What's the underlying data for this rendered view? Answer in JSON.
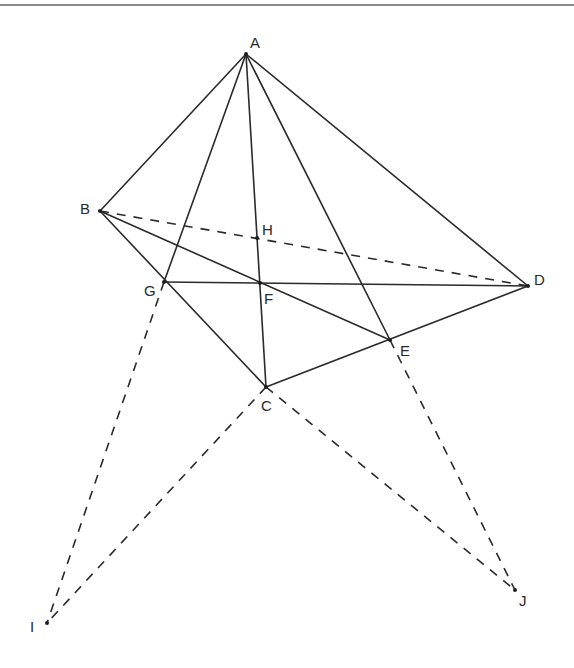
{
  "figure": {
    "type": "geometry-diagram",
    "points": {
      "A": {
        "label": "A",
        "x": 246,
        "y": 54
      },
      "B": {
        "label": "B",
        "x": 100,
        "y": 211
      },
      "C": {
        "label": "C",
        "x": 266,
        "y": 387
      },
      "D": {
        "label": "D",
        "x": 528,
        "y": 286
      },
      "E": {
        "label": "E",
        "x": 390,
        "y": 340
      },
      "F": {
        "label": "F",
        "x": 260,
        "y": 283
      },
      "G": {
        "label": "G",
        "x": 164,
        "y": 282
      },
      "H": {
        "label": "H",
        "x": 257,
        "y": 238
      },
      "I": {
        "label": "I",
        "x": 47,
        "y": 623
      },
      "J": {
        "label": "J",
        "x": 515,
        "y": 590
      }
    },
    "solid_segments": [
      [
        "A",
        "B"
      ],
      [
        "A",
        "D"
      ],
      [
        "A",
        "G"
      ],
      [
        "A",
        "C"
      ],
      [
        "A",
        "E"
      ],
      [
        "B",
        "C"
      ],
      [
        "B",
        "E"
      ],
      [
        "C",
        "D"
      ],
      [
        "G",
        "D"
      ]
    ],
    "dashed_segments": [
      [
        "B",
        "D"
      ],
      [
        "G",
        "I"
      ],
      [
        "C",
        "I"
      ],
      [
        "C",
        "J"
      ],
      [
        "E",
        "J"
      ]
    ],
    "colors": {
      "line": "#2a2a2a",
      "background": "#ffffff",
      "top_rule": "#8a8a8a"
    }
  }
}
